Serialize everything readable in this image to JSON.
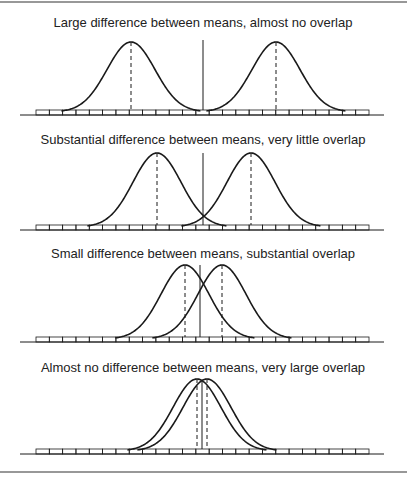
{
  "figure": {
    "border_top_y": 2,
    "border_bottom_y": 472,
    "line_color": "#1a1a1a",
    "panels": [
      {
        "title": "Large difference between means, almost no overlap",
        "title_y": 27,
        "peak_y": 42,
        "baseline_y": 115,
        "means_x": [
          131,
          276
        ],
        "sigma": 24,
        "center_x": 203,
        "center_top_y": 40
      },
      {
        "title": "Substantial difference between means, very little overlap",
        "title_y": 144,
        "peak_y": 153,
        "baseline_y": 230,
        "means_x": [
          157,
          251
        ],
        "sigma": 24,
        "center_x": 203,
        "center_top_y": 153
      },
      {
        "title": "Small difference between means, substantial overlap",
        "title_y": 258,
        "peak_y": 265,
        "baseline_y": 342,
        "means_x": [
          185,
          222
        ],
        "sigma": 24,
        "center_x": 200,
        "center_top_y": 265
      },
      {
        "title": "Almost no difference between means, very large overlap",
        "title_y": 372,
        "peak_y": 379,
        "baseline_y": 454,
        "means_x": [
          197,
          207
        ],
        "sigma": 24,
        "center_x": 202,
        "center_top_y": 380
      }
    ],
    "axis": {
      "line_x0": 20,
      "line_x1": 384,
      "boxes_x0": 36,
      "boxes_x1": 369,
      "box_count": 25,
      "box_height": 5
    }
  }
}
